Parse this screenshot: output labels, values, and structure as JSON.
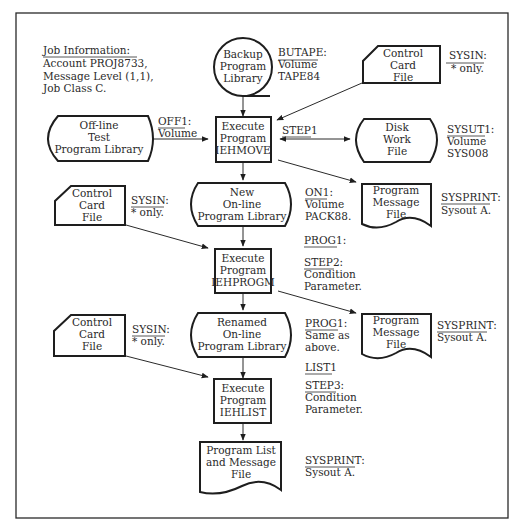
{
  "job_info": {
    "heading": "Job Information:",
    "lines": [
      "Account PROJ8733,",
      "Message Level (1,1),",
      "Job Class C."
    ]
  },
  "nodes": {
    "backup_library": {
      "lines": [
        "Backup",
        "Program",
        "Library"
      ],
      "shape": "magnetic-tape"
    },
    "control_card_1": {
      "lines": [
        "Control",
        "Card",
        "File"
      ],
      "shape": "punched-card"
    },
    "offline_library": {
      "lines": [
        "Off-line",
        "Test",
        "Program Library"
      ],
      "shape": "online-storage"
    },
    "step1_process": {
      "lines": [
        "Execute",
        "Program",
        "IEHMOVE"
      ],
      "shape": "process"
    },
    "disk_work_file": {
      "lines": [
        "Disk",
        "Work",
        "File"
      ],
      "shape": "online-storage"
    },
    "new_online_library": {
      "lines": [
        "New",
        "On-line",
        "Program Library"
      ],
      "shape": "online-storage"
    },
    "message_file_1": {
      "lines": [
        "Program",
        "Message",
        "File"
      ],
      "shape": "document"
    },
    "control_card_2": {
      "lines": [
        "Control",
        "Card",
        "File"
      ],
      "shape": "punched-card"
    },
    "step2_process": {
      "lines": [
        "Execute",
        "Program",
        "IEHPROGM"
      ],
      "shape": "process"
    },
    "message_file_2": {
      "lines": [
        "Program",
        "Message",
        "File"
      ],
      "shape": "document"
    },
    "control_card_3": {
      "lines": [
        "Control",
        "Card",
        "File"
      ],
      "shape": "punched-card"
    },
    "renamed_library": {
      "lines": [
        "Renamed",
        "On-line",
        "Program Library"
      ],
      "shape": "online-storage"
    },
    "step3_process": {
      "lines": [
        "Execute",
        "Program",
        "IEHLIST"
      ],
      "shape": "process"
    },
    "list_message_file": {
      "lines": [
        "Program List",
        "and Message",
        "File"
      ],
      "shape": "document"
    }
  },
  "annotations": {
    "butape": {
      "title": "BUTAPE:",
      "lines": [
        "Volume",
        "TAPE84"
      ]
    },
    "sysin_1": {
      "title": "SYSIN:",
      "lines": [
        "* only."
      ]
    },
    "off1": {
      "title": "OFF1:",
      "lines": [
        "Volume"
      ]
    },
    "step1": {
      "title": "STEP1",
      "lines": []
    },
    "sysut1": {
      "title": "SYSUT1:",
      "lines": [
        "Volume",
        "SYS008"
      ]
    },
    "on1": {
      "title": "ON1:",
      "lines": [
        "Volume",
        "PACK88."
      ]
    },
    "sysprint_1": {
      "title": "SYSPRINT:",
      "lines": [
        "Sysout A."
      ]
    },
    "sysin_2": {
      "title": "SYSIN:",
      "lines": [
        "* only."
      ]
    },
    "prog1_a": {
      "title": "PROG1:",
      "lines": []
    },
    "step2": {
      "title": "STEP2:",
      "lines": [
        "Condition",
        "Parameter."
      ]
    },
    "sysprint_2": {
      "title": "SYSPRINT:",
      "lines": [
        "Sysout A."
      ]
    },
    "sysin_3": {
      "title": "SYSIN:",
      "lines": [
        "* only."
      ]
    },
    "prog1_b": {
      "title": "PROG1:",
      "lines": [
        "Same as",
        "above."
      ]
    },
    "list1": {
      "title": "LIST1",
      "lines": []
    },
    "step3": {
      "title": "STEP3:",
      "lines": [
        "Condition",
        "Parameter."
      ]
    },
    "sysprint_3": {
      "title": "SYSPRINT:",
      "lines": [
        "Sysout A."
      ]
    }
  },
  "edges": [
    {
      "from": "backup_library",
      "to": "step1_process"
    },
    {
      "from": "control_card_1",
      "to": "step1_process"
    },
    {
      "from": "offline_library",
      "to": "step1_process"
    },
    {
      "from": "step1_process",
      "to": "disk_work_file",
      "bidirectional": true
    },
    {
      "from": "step1_process",
      "to": "new_online_library"
    },
    {
      "from": "step1_process",
      "to": "message_file_1"
    },
    {
      "from": "new_online_library",
      "to": "step2_process"
    },
    {
      "from": "control_card_2",
      "to": "step2_process"
    },
    {
      "from": "step2_process",
      "to": "renamed_library"
    },
    {
      "from": "step2_process",
      "to": "message_file_2"
    },
    {
      "from": "renamed_library",
      "to": "step3_process"
    },
    {
      "from": "control_card_3",
      "to": "step3_process"
    },
    {
      "from": "step3_process",
      "to": "list_message_file"
    }
  ]
}
